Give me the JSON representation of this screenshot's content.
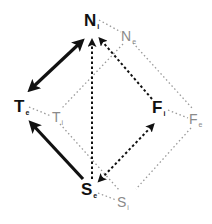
{
  "diagram": {
    "colors": {
      "primary": "#111111",
      "secondary": "#8a8a8a",
      "background": "#ffffff"
    },
    "nodes": {
      "N_i": {
        "letter": "N",
        "subscript": "i"
      },
      "N_e": {
        "letter": "N",
        "subscript": "e"
      },
      "T_e": {
        "letter": "T",
        "subscript": "e"
      },
      "T_i": {
        "letter": "T",
        "subscript": "i"
      },
      "F_i": {
        "letter": "F",
        "subscript": "i"
      },
      "F_e": {
        "letter": "F",
        "subscript": "e"
      },
      "S_e": {
        "letter": "S",
        "subscript": "e"
      },
      "S_i": {
        "letter": "S",
        "subscript": "i"
      }
    },
    "edges": [
      {
        "from": "T_e",
        "to": "N_i",
        "style": "bold-solid",
        "arrows": "both"
      },
      {
        "from": "S_e",
        "to": "T_e",
        "style": "bold-solid",
        "arrows": "end"
      },
      {
        "from": "S_e",
        "to": "N_i",
        "style": "dashed",
        "arrows": "end"
      },
      {
        "from": "F_i",
        "to": "N_i",
        "style": "dashed",
        "arrows": "end"
      },
      {
        "from": "S_e",
        "to": "F_i",
        "style": "dashed",
        "arrows": "both"
      },
      {
        "from": "N_i",
        "to": "N_e",
        "style": "light-dotted",
        "arrows": "none"
      },
      {
        "from": "T_e",
        "to": "T_i",
        "style": "light-dotted",
        "arrows": "none"
      },
      {
        "from": "F_i",
        "to": "F_e",
        "style": "light-dotted",
        "arrows": "none"
      },
      {
        "from": "S_e",
        "to": "S_i",
        "style": "light-dotted",
        "arrows": "none"
      },
      {
        "from": "N_e",
        "to": "T_i",
        "style": "light-dotted",
        "arrows": "none"
      },
      {
        "from": "N_e",
        "to": "F_e",
        "style": "light-dotted",
        "arrows": "none"
      },
      {
        "from": "T_i",
        "to": "S_i",
        "style": "light-dotted",
        "arrows": "none"
      },
      {
        "from": "F_e",
        "to": "S_i",
        "style": "light-dotted",
        "arrows": "none"
      }
    ]
  }
}
